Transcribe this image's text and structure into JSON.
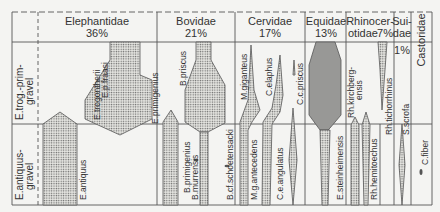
{
  "families": [
    {
      "name": "Elephantidae",
      "pct": "36%"
    },
    {
      "name": "Bovidae",
      "pct": "21%"
    },
    {
      "name": "Cervidae",
      "pct": "17%"
    },
    {
      "name": "Equidae",
      "pct": "13%"
    },
    {
      "name": "Rhinocer-",
      "name2": "otidae",
      "pct": "7%"
    },
    {
      "name": "Sui-",
      "name2": "dae",
      "pct": "1%"
    },
    {
      "name": "Castoridae",
      "pct": ""
    }
  ],
  "rows": [
    {
      "line1": "E.trog.-prim-",
      "line2": "gravel"
    },
    {
      "line1": "E.antiquus-",
      "line2": "gravel"
    }
  ],
  "taxa": {
    "e_trogontherii": "E.trogontherii",
    "e_p_fraasi": "E.p.fraasi",
    "e_primigenius": "E.primigenius",
    "e_antiquus": "E.antiquus",
    "b_priscus": "B.priscus",
    "b_primigenius": "B.primigenius",
    "b_murrensis": "B.murrensis",
    "b_cf_schoetensacki": "B.cf.schoetensacki",
    "m_giganteus": "M.giganteus",
    "m_g_antecedens": "M.g.antecedens",
    "c_elaphus": "C.elaphus",
    "c_e_angulatus": "C.e.angulatus",
    "c_c_priscus": "C.c.priscus",
    "e_steinheimensis": "E.steinheimensis",
    "rh_kirchbergensis_1": "Rh.kirchberg-",
    "rh_kirchbergensis_2": "ensis",
    "rh_hemitoechus": "Rh.hemitoechus",
    "rh_tichorrhinus": "Rh.tichorrhinus",
    "s_scrofa": "S.scrofa",
    "c_fiber": "C.fiber"
  }
}
